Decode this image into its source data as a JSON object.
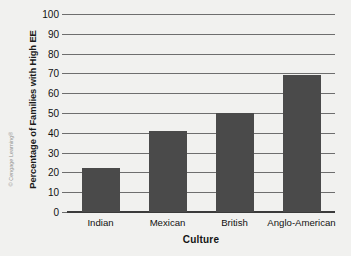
{
  "credit": "© Cengage Learning®",
  "chart_data": {
    "type": "bar",
    "title": "",
    "xlabel": "Culture",
    "ylabel": "Percentage of Families with High EE",
    "categories": [
      "Indian",
      "Mexican",
      "British",
      "Anglo-American"
    ],
    "values": [
      22,
      41,
      50,
      69
    ],
    "series": [
      {
        "name": "Percentage of Families with High EE",
        "values": [
          22,
          41,
          50,
          69
        ]
      }
    ],
    "ylim": [
      0,
      100
    ],
    "ytick_step": 10,
    "yticks": [
      0,
      10,
      20,
      30,
      40,
      50,
      60,
      70,
      80,
      90,
      100
    ],
    "ytick_labels": [
      "0",
      "10",
      "20",
      "30",
      "40",
      "50",
      "60",
      "70",
      "80",
      "90",
      "100"
    ],
    "grid": true,
    "grid_axis": "y",
    "legend": false,
    "legend_position": "none",
    "bar_color": "#4a4a4a",
    "background_color": "#f1f1ef",
    "gridline_color": "#6e6e6e",
    "axis_color": "#3b3b3b"
  }
}
